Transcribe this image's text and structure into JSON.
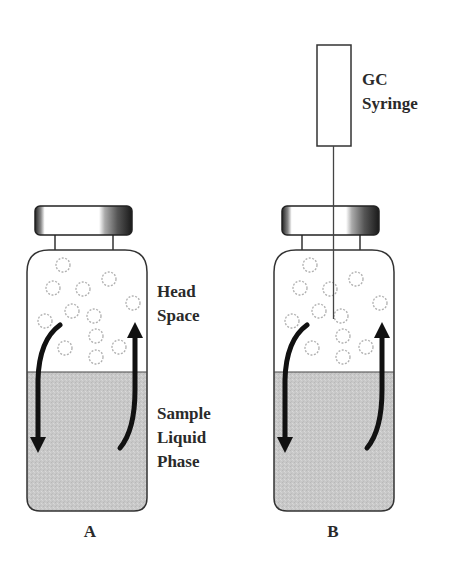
{
  "labels": {
    "head_space": [
      "Head",
      "Space"
    ],
    "sample_liquid_phase": [
      "Sample",
      "Liquid",
      "Phase"
    ],
    "gc_syringe": [
      "GC",
      "Syringe"
    ]
  },
  "panels": [
    {
      "id": "A",
      "label": "A",
      "has_syringe": false
    },
    {
      "id": "B",
      "label": "B",
      "has_syringe": true
    }
  ],
  "colors": {
    "liquid": "#c9c9c9",
    "outline": "#333333",
    "arrow": "#111111",
    "bubble": "#b0b0b0",
    "text": "#2a2a2a"
  }
}
